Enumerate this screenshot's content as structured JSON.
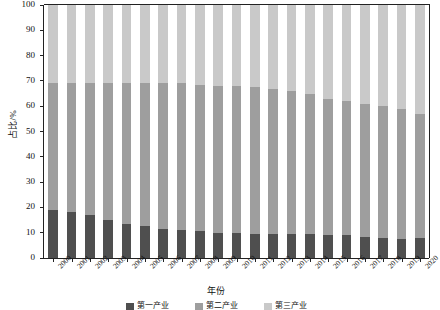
{
  "chart_data": {
    "type": "bar",
    "subtype": "stacked-100-percent",
    "title": "",
    "xlabel": "年份",
    "ylabel": "占比/%",
    "ylim": [
      0,
      100
    ],
    "ytick_step": 10,
    "yticks": [
      0,
      10,
      20,
      30,
      40,
      50,
      60,
      70,
      80,
      90,
      100
    ],
    "grid": false,
    "legend_position": "bottom",
    "categories": [
      "2000",
      "2001",
      "2002",
      "2003",
      "2004",
      "2005",
      "2006",
      "2007",
      "2008",
      "2009",
      "2010",
      "2011",
      "2012",
      "2013",
      "2014",
      "2015",
      "2016",
      "2017",
      "2018",
      "2019",
      "2020"
    ],
    "series": [
      {
        "name": "第一产业",
        "color": "#4f4f4f",
        "values": [
          19.0,
          18.0,
          17.0,
          15.0,
          13.5,
          12.5,
          11.5,
          11.0,
          10.5,
          10.0,
          9.8,
          9.5,
          9.5,
          9.4,
          9.3,
          9.0,
          9.0,
          8.5,
          8.0,
          7.5,
          8.0
        ]
      },
      {
        "name": "第二产业",
        "color": "#9e9e9e",
        "values": [
          50.0,
          51.0,
          52.0,
          54.0,
          55.5,
          56.5,
          57.5,
          58.0,
          58.0,
          58.0,
          58.2,
          58.0,
          57.5,
          56.6,
          55.7,
          54.0,
          53.0,
          52.5,
          52.0,
          51.5,
          49.0
        ]
      },
      {
        "name": "第三产业",
        "color": "#c9c9c9",
        "values": [
          31.0,
          31.0,
          31.0,
          31.0,
          31.0,
          31.0,
          31.0,
          31.0,
          31.5,
          32.0,
          32.0,
          32.5,
          33.0,
          34.0,
          35.0,
          37.0,
          38.0,
          39.0,
          40.0,
          41.0,
          43.0
        ]
      }
    ],
    "series_cumulative_tops": {
      "note": "Upper boundary of 第二产业 (primary+secondary) in percent",
      "values": [
        69.0,
        69.0,
        69.0,
        69.0,
        69.0,
        69.0,
        69.0,
        69.0,
        68.5,
        68.0,
        68.0,
        67.5,
        67.0,
        66.0,
        65.0,
        63.0,
        62.0,
        61.0,
        60.0,
        59.0,
        57.0
      ]
    }
  },
  "legend": {
    "items": [
      {
        "label": "第一产业",
        "color": "#4f4f4f"
      },
      {
        "label": "第二产业",
        "color": "#9e9e9e"
      },
      {
        "label": "第三产业",
        "color": "#c9c9c9"
      }
    ]
  }
}
